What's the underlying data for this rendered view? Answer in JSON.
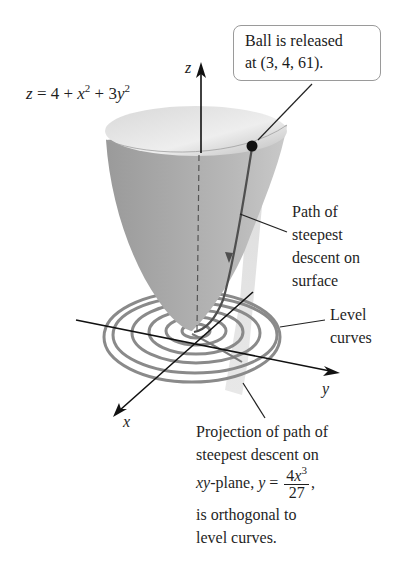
{
  "figure": {
    "equation": {
      "lhs": "z",
      "rhs_parts": [
        "4 + ",
        "x",
        "2",
        " + 3",
        "y",
        "2"
      ],
      "full": "z = 4 + x^2 + 3y^2"
    },
    "axes": {
      "z": "z",
      "y": "y",
      "x": "x"
    },
    "callout_release": {
      "line1": "Ball is released",
      "line2": "at (3, 4, 61)."
    },
    "label_path": [
      "Path of",
      "steepest",
      "descent on",
      "surface"
    ],
    "label_level": [
      "Level",
      "curves"
    ],
    "label_projection": {
      "line1": "Projection of path of",
      "line2": "steepest descent on",
      "line3_prefix": "xy",
      "line3_middle": "-plane, ",
      "line3_var": "y",
      "line3_eq": " = ",
      "frac_num_coef": "4",
      "frac_num_var": "x",
      "frac_num_exp": "3",
      "frac_den": "27",
      "line3_suffix": ",",
      "line4": "is orthogonal to",
      "line5": "level curves."
    },
    "release_point": [
      3,
      4,
      61
    ],
    "colors": {
      "surface_light": "#e6e6e6",
      "surface_dark": "#8c8c8c",
      "level_curves": "#8a8a8a",
      "path": "#555555",
      "axis": "#111111"
    }
  }
}
